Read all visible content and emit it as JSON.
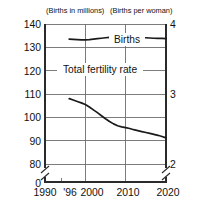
{
  "chart_data": {
    "type": "line",
    "title": "",
    "xlabel": "",
    "ylabel": "(Births in millions)",
    "y2label": "(Births per woman)",
    "left_axis_header": "(Births in millions)",
    "right_axis_header": "(Births per woman)",
    "x": [
      1996,
      1997,
      1998,
      1999,
      2000,
      2001,
      2002,
      2003,
      2004,
      2005,
      2006,
      2007,
      2008,
      2009,
      2010,
      2011,
      2012,
      2013,
      2014,
      2015,
      2016,
      2017,
      2018,
      2019,
      2020
    ],
    "xlim": [
      1990,
      2020
    ],
    "ylim": [
      80,
      140
    ],
    "y2lim": [
      2,
      4
    ],
    "grid": true,
    "legend_position": "inline-annotation",
    "xticks": [
      {
        "value": 1990,
        "label": "1990"
      },
      {
        "value": 1996,
        "label": "'96"
      },
      {
        "value": 2000,
        "label": "2000"
      },
      {
        "value": 2010,
        "label": "2010"
      },
      {
        "value": 2020,
        "label": "2020"
      }
    ],
    "xgridlines": [
      2000,
      2010
    ],
    "yticks_left": [
      {
        "value": 140,
        "label": "140"
      },
      {
        "value": 130,
        "label": "130"
      },
      {
        "value": 120,
        "label": "120"
      },
      {
        "value": 110,
        "label": "110"
      },
      {
        "value": 100,
        "label": "100"
      },
      {
        "value": 90,
        "label": "90"
      },
      {
        "value": 80,
        "label": "80"
      },
      {
        "value": 0,
        "label": "0"
      }
    ],
    "yticks_right": [
      {
        "value": 4,
        "label": "4"
      },
      {
        "value": 3,
        "label": "3"
      },
      {
        "value": 2,
        "label": "2"
      }
    ],
    "axis_break": true,
    "origin_label": "0",
    "series": [
      {
        "name": "Births",
        "axis": "left",
        "units": "millions",
        "label": "Births",
        "values": [
          133.5,
          133.4,
          133.3,
          133.2,
          133.2,
          133.3,
          133.5,
          133.7,
          133.9,
          134.1,
          134.3,
          134.4,
          134.5,
          134.5,
          134.5,
          134.5,
          134.4,
          134.3,
          134.2,
          134.1,
          134.0,
          133.9,
          133.8,
          133.8,
          133.7
        ]
      },
      {
        "name": "Total fertility rate",
        "axis": "right",
        "units": "births per woman",
        "label": "Total fertility rate",
        "values_left_scale": [
          108.0,
          107.4,
          106.8,
          106.2,
          105.5,
          104.4,
          103.2,
          102.0,
          100.7,
          99.4,
          98.2,
          97.2,
          96.4,
          95.9,
          95.6,
          95.2,
          94.7,
          94.3,
          93.9,
          93.5,
          93.1,
          92.7,
          92.3,
          91.8,
          91.2
        ],
        "values": [
          2.933,
          2.913,
          2.893,
          2.873,
          2.85,
          2.813,
          2.773,
          2.733,
          2.69,
          2.647,
          2.607,
          2.573,
          2.547,
          2.53,
          2.52,
          2.507,
          2.49,
          2.477,
          2.463,
          2.45,
          2.437,
          2.423,
          2.41,
          2.393,
          2.373
        ]
      }
    ],
    "annotations": [
      {
        "name": "births-label",
        "text": "Births",
        "x": 2006,
        "y": 128.5
      },
      {
        "name": "tfr-label",
        "text": "Total fertility rate",
        "x": 2001,
        "y": 113.5
      }
    ]
  }
}
